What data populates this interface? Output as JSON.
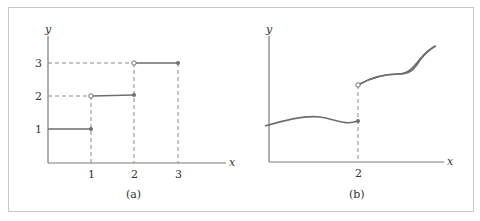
{
  "figure": {
    "panels": [
      {
        "id": "a",
        "caption": "(a)",
        "x_axis_label": "x",
        "y_axis_label": "y",
        "x_ticks": [
          "1",
          "2",
          "3"
        ],
        "y_ticks": [
          "1",
          "2",
          "3"
        ],
        "description": "Step function: y=1 on (0,1], y=2 on (1,2], y=3 on (2,3]; open circles at left ends of upper steps, closed dots at right ends"
      },
      {
        "id": "b",
        "caption": "(b)",
        "x_axis_label": "x",
        "y_axis_label": "y",
        "x_ticks": [
          "2"
        ],
        "description": "Smooth curve with a jump discontinuity at x=2; closed dot on the lower branch, open circle on the upper branch"
      }
    ]
  },
  "colors": {
    "line": "#6e6e6e",
    "axis": "#7a7a7a",
    "frame": "#c8c8c8",
    "background": "#ffffff"
  }
}
